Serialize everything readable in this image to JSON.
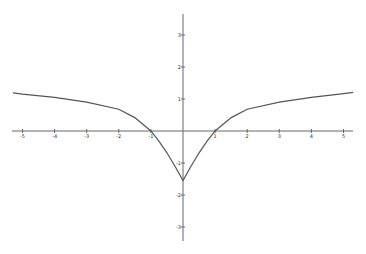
{
  "chart_data": {
    "type": "line",
    "title": "",
    "xlabel": "",
    "ylabel": "",
    "xlim": [
      -5.3,
      5.3
    ],
    "ylim": [
      -3.4,
      3.6
    ],
    "grid": false,
    "legend": null,
    "x_ticks": [
      "-5",
      "-4",
      "-3",
      "-2",
      "-1",
      "1",
      "2",
      "3",
      "4",
      "5"
    ],
    "y_ticks": [
      "3",
      "2",
      "1",
      "-1",
      "-2",
      "-3"
    ],
    "series": [
      {
        "name": "f(x)",
        "color": "#555555",
        "x": [
          -5.3,
          -5,
          -4,
          -3,
          -2,
          -1.5,
          -1,
          -0.75,
          -0.5,
          -0.25,
          0,
          0.25,
          0.5,
          0.75,
          1,
          1.5,
          2,
          3,
          4,
          5,
          5.3
        ],
        "y": [
          1.19,
          1.15,
          1.05,
          0.9,
          0.68,
          0.42,
          0.0,
          -0.32,
          -0.68,
          -1.1,
          -1.55,
          -1.1,
          -0.68,
          -0.32,
          0.0,
          0.42,
          0.68,
          0.9,
          1.05,
          1.17,
          1.21
        ]
      }
    ]
  },
  "colors": {
    "axis": "#666666",
    "curve": "#555555",
    "background": "#ffffff"
  }
}
